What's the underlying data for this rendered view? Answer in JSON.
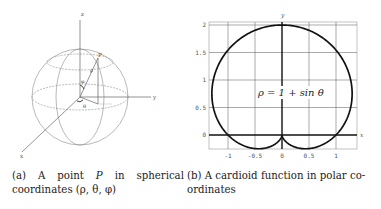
{
  "figure_a": {
    "axis_labels": {
      "x": "x",
      "y": "y",
      "z": "z"
    },
    "point_label": "P",
    "angle_labels": {
      "phi": "φ",
      "theta": "θ",
      "rho": "ρ"
    },
    "caption": {
      "tag": "(a)",
      "line1_words": [
        "(a)",
        "A",
        "point",
        "P",
        "in",
        "spherical"
      ],
      "line2": "coordinates (ρ, θ, φ)"
    }
  },
  "figure_b": {
    "caption": {
      "line1": "(b) A cardioid function in polar co-",
      "line2": "ordinates"
    }
  },
  "chart_data": {
    "type": "line",
    "title": "",
    "equation_label": "ρ = 1 + sin θ",
    "xlabel": "x",
    "ylabel": "y",
    "xlim": [
      -1.35,
      1.4
    ],
    "ylim": [
      -0.25,
      2.05
    ],
    "xticks": [
      -1,
      -0.5,
      0,
      0.5,
      1
    ],
    "xtick_labels": [
      "-1",
      "-0.5",
      "0",
      "0.5",
      "1"
    ],
    "yticks": [
      0,
      0.5,
      1,
      1.5,
      2
    ],
    "ytick_labels": [
      "0",
      "0.5",
      "1",
      "1.5",
      "2"
    ],
    "grid": true,
    "series": [
      {
        "name": "cardioid",
        "polar": true,
        "rho": "1 + sin(theta)",
        "theta_range": [
          0,
          6.2832
        ],
        "sample_points": [
          {
            "x": 1.0,
            "y": 0.0
          },
          {
            "x": 1.3,
            "y": 0.75
          },
          {
            "x": 1.0,
            "y": 1.73
          },
          {
            "x": 0.0,
            "y": 2.0
          },
          {
            "x": -1.0,
            "y": 1.73
          },
          {
            "x": -1.3,
            "y": 0.75
          },
          {
            "x": -1.0,
            "y": 0.0
          },
          {
            "x": -0.43,
            "y": -0.25
          },
          {
            "x": 0.0,
            "y": 0.0
          },
          {
            "x": 0.43,
            "y": -0.25
          }
        ]
      }
    ]
  }
}
